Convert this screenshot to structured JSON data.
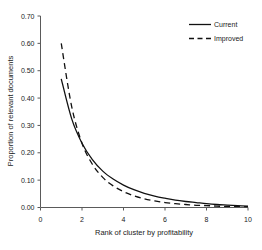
{
  "chart_data": {
    "type": "line",
    "title": "",
    "xlabel": "Rank of cluster by profitability",
    "ylabel": "Proportion of relevant documents",
    "xlim": [
      0,
      10
    ],
    "ylim": [
      0.0,
      0.7
    ],
    "xticks": [
      "0",
      "2",
      "4",
      "6",
      "8",
      "10"
    ],
    "xtick_values": [
      0,
      2,
      4,
      6,
      8,
      10
    ],
    "yticks": [
      "0.00",
      "0.10",
      "0.20",
      "0.30",
      "0.40",
      "0.50",
      "0.60",
      "0.70"
    ],
    "ytick_values": [
      0.0,
      0.1,
      0.2,
      0.3,
      0.4,
      0.5,
      0.6,
      0.7
    ],
    "grid": false,
    "legend_position": "top-right",
    "x": [
      1,
      1.5,
      2,
      2.5,
      3,
      3.5,
      4,
      4.5,
      5,
      5.5,
      6,
      6.5,
      7,
      7.5,
      8,
      8.5,
      9,
      9.5,
      10
    ],
    "series": [
      {
        "name": "Current",
        "style": "solid",
        "color": "#111111",
        "values": [
          0.47,
          0.325,
          0.235,
          0.175,
          0.133,
          0.104,
          0.082,
          0.065,
          0.052,
          0.042,
          0.034,
          0.027,
          0.022,
          0.018,
          0.014,
          0.011,
          0.009,
          0.007,
          0.005
        ]
      },
      {
        "name": "Improved",
        "style": "dashed",
        "color": "#111111",
        "values": [
          0.6,
          0.37,
          0.235,
          0.158,
          0.11,
          0.079,
          0.058,
          0.043,
          0.032,
          0.024,
          0.018,
          0.014,
          0.011,
          0.008,
          0.007,
          0.005,
          0.004,
          0.004,
          0.003
        ]
      }
    ]
  },
  "legend": {
    "items": [
      {
        "label": "Current"
      },
      {
        "label": "Improved"
      }
    ]
  },
  "axes": {
    "x_title": "Rank of cluster by profitability",
    "y_title": "Proportion of relevant documents"
  }
}
